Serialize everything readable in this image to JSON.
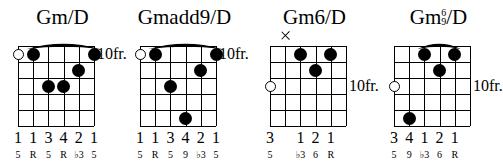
{
  "document": {
    "type": "guitar-chord-chart",
    "fret_label_default": "10fr.",
    "strings": 6,
    "frets": 5
  },
  "chords": [
    {
      "name": "Gm/D",
      "title_main": "Gm/D",
      "fret_label": "10fr.",
      "fret_label_position": "nut",
      "barre": {
        "present": true,
        "from_string": 2,
        "to_string": 6,
        "fret": 1
      },
      "markers": [
        {
          "type": "open",
          "string": 1
        },
        {
          "type": "dot",
          "string": 2,
          "fret": 1
        },
        {
          "type": "dot",
          "string": 3,
          "fret": 3
        },
        {
          "type": "dot",
          "string": 4,
          "fret": 3
        },
        {
          "type": "dot",
          "string": 5,
          "fret": 2
        },
        {
          "type": "dot",
          "string": 6,
          "fret": 1
        }
      ],
      "fingers": [
        "1",
        "1",
        "3",
        "4",
        "2",
        "1"
      ],
      "intervals": [
        "5",
        "R",
        "5",
        "R",
        "♭3",
        "5"
      ]
    },
    {
      "name": "Gmadd9/D",
      "title_main": "Gmadd9/D",
      "fret_label": "10fr.",
      "fret_label_position": "nut",
      "barre": {
        "present": true,
        "from_string": 2,
        "to_string": 6,
        "fret": 1
      },
      "markers": [
        {
          "type": "open",
          "string": 1
        },
        {
          "type": "dot",
          "string": 2,
          "fret": 1
        },
        {
          "type": "dot",
          "string": 3,
          "fret": 3
        },
        {
          "type": "dot",
          "string": 4,
          "fret": 5
        },
        {
          "type": "dot",
          "string": 5,
          "fret": 2
        },
        {
          "type": "dot",
          "string": 6,
          "fret": 1
        }
      ],
      "fingers": [
        "1",
        "1",
        "3",
        "4",
        "2",
        "1"
      ],
      "intervals": [
        "5",
        "R",
        "5",
        "9",
        "♭3",
        "5"
      ]
    },
    {
      "name": "Gm6/D",
      "title_main": "Gm6/D",
      "fret_label": "10fr.",
      "fret_label_position": "fret3",
      "barre": {
        "present": false
      },
      "markers": [
        {
          "type": "open",
          "string": 1,
          "fret": 3
        },
        {
          "type": "mute",
          "string": 2
        },
        {
          "type": "dot",
          "string": 3,
          "fret": 1
        },
        {
          "type": "dot",
          "string": 4,
          "fret": 2
        },
        {
          "type": "dot",
          "string": 5,
          "fret": 1
        }
      ],
      "fingers": [
        "3",
        "",
        "1",
        "2",
        "1",
        ""
      ],
      "intervals": [
        "5",
        "",
        "♭3",
        "6",
        "R",
        ""
      ]
    },
    {
      "name": "Gm6/9/D",
      "title_prefix": "Gm",
      "title_stack_top": "6",
      "title_stack_bottom": "9",
      "title_suffix": "/D",
      "fret_label": "10fr.",
      "fret_label_position": "fret3",
      "barre": {
        "present": true,
        "from_string": 3,
        "to_string": 5,
        "fret": 1
      },
      "markers": [
        {
          "type": "open",
          "string": 1,
          "fret": 3
        },
        {
          "type": "dot",
          "string": 2,
          "fret": 5
        },
        {
          "type": "dot",
          "string": 3,
          "fret": 1
        },
        {
          "type": "dot",
          "string": 4,
          "fret": 2
        },
        {
          "type": "dot",
          "string": 5,
          "fret": 1
        }
      ],
      "fingers": [
        "3",
        "4",
        "1",
        "2",
        "1",
        ""
      ],
      "intervals": [
        "5",
        "9",
        "♭3",
        "6",
        "R",
        ""
      ]
    }
  ]
}
